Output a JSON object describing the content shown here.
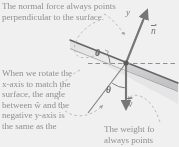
{
  "figure": {
    "kind": "free-body-diagram-inclined-plane",
    "width": 179,
    "height": 147
  },
  "captions": {
    "top": {
      "line1": "The normal force always points",
      "line2": "perpendicular to the surface."
    },
    "left": {
      "line1": "When we rotate the",
      "line2": "x-axis to match the",
      "line3": "surface, the angle",
      "line4": "between ŵ and the",
      "line5": "negative y-axis is",
      "line6": "the same as the"
    },
    "right": {
      "line1": "The weight fo",
      "line2": "always points"
    }
  },
  "labels": {
    "axis_y": "y",
    "normal_vector": "n",
    "weight_vector": "w",
    "angle_top": "θ",
    "angle_bottom": "θ"
  },
  "colors": {
    "text": "#8e8e8e",
    "label": "#6f6f6f",
    "incline_line": "#58585a",
    "incline_fill": "#d9d9db",
    "vector": "#6e6e72",
    "dashed": "#8d8d90",
    "leader": "#aeaeb2"
  }
}
